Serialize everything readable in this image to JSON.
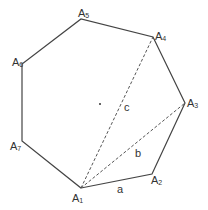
{
  "diagram": {
    "stroke_color": "#444444",
    "vertices": [
      {
        "name": "A1",
        "base": "A",
        "sub": "1",
        "x": 81,
        "y": 188,
        "lx": 72,
        "ly": 202
      },
      {
        "name": "A2",
        "base": "A",
        "sub": "2",
        "x": 152,
        "y": 174,
        "lx": 151,
        "ly": 184
      },
      {
        "name": "A3",
        "base": "A",
        "sub": "3",
        "x": 185,
        "y": 103,
        "lx": 187,
        "ly": 107
      },
      {
        "name": "A4",
        "base": "A",
        "sub": "4",
        "x": 153,
        "y": 37,
        "lx": 155,
        "ly": 40
      },
      {
        "name": "A5",
        "base": "A",
        "sub": "5",
        "x": 81,
        "y": 19,
        "lx": 78,
        "ly": 17
      },
      {
        "name": "A6",
        "base": "A",
        "sub": "6",
        "x": 22,
        "y": 64,
        "lx": 12,
        "ly": 66
      },
      {
        "name": "A7",
        "base": "A",
        "sub": "7",
        "x": 22,
        "y": 141,
        "lx": 10,
        "ly": 150
      }
    ],
    "center": {
      "x": 100,
      "y": 104
    },
    "diagonals": [
      {
        "from": "A1",
        "to": "A3",
        "label": "b"
      },
      {
        "from": "A1",
        "to": "A4",
        "label": "c"
      }
    ],
    "side_label": {
      "from": "A1",
      "to": "A2",
      "label": "a"
    },
    "edge_labels": {
      "a": {
        "text": "a",
        "x": 117,
        "y": 193
      },
      "b": {
        "text": "b",
        "x": 135,
        "y": 157
      },
      "c": {
        "text": "c",
        "x": 124,
        "y": 111
      }
    }
  }
}
